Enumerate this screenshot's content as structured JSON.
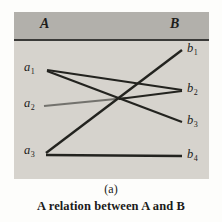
{
  "figure": {
    "panel": {
      "set_a_header": "A",
      "set_b_header": "B",
      "background_color": "#d6d3cd",
      "header_color": "#b2b0ab",
      "rule_color": "#3a3a38"
    },
    "set_a_nodes": [
      {
        "id": "a1",
        "label": "a",
        "subscript": "1"
      },
      {
        "id": "a2",
        "label": "a",
        "subscript": "2"
      },
      {
        "id": "a3",
        "label": "a",
        "subscript": "3"
      }
    ],
    "set_b_nodes": [
      {
        "id": "b1",
        "label": "b",
        "subscript": "1"
      },
      {
        "id": "b2",
        "label": "b",
        "subscript": "2"
      },
      {
        "id": "b3",
        "label": "b",
        "subscript": "3"
      },
      {
        "id": "b4",
        "label": "b",
        "subscript": "4"
      }
    ],
    "edges": [
      {
        "from": "a1",
        "to": "b2"
      },
      {
        "from": "a1",
        "to": "b3"
      },
      {
        "from": "a2",
        "to": "b2"
      },
      {
        "from": "a3",
        "to": "b1"
      },
      {
        "from": "a3",
        "to": "b4"
      }
    ],
    "edge_color": "#23231f"
  },
  "caption": {
    "sub": "(a)",
    "main": "A relation between A and B"
  }
}
